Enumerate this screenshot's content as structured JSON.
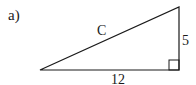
{
  "figure": {
    "label": "a)",
    "triangle": {
      "type": "right-triangle",
      "hypotenuse_label": "C",
      "vertical_leg_label": "5",
      "horizontal_leg_label": "12",
      "right_angle_marker": true
    },
    "colors": {
      "stroke": "#1a1a1a",
      "background": "#ffffff"
    }
  }
}
